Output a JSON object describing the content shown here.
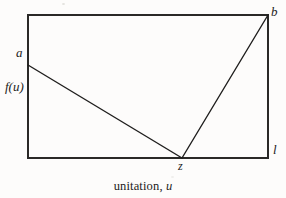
{
  "figure": {
    "caption_prefix": "unitation, ",
    "caption_variable": "u",
    "labels": {
      "a": "a",
      "b": "b",
      "l": "l",
      "z": "z",
      "f_of_u": "f(u)"
    },
    "colors": {
      "line": "#1f1e1d",
      "frame": "#2a2927",
      "background": "#fdfcfb",
      "text": "#1c1b1a"
    }
  },
  "chart_data": {
    "type": "line",
    "title": "",
    "subtitle": "",
    "xlabel": "unitation, u",
    "ylabel": "f(u)",
    "grid": false,
    "legend": null,
    "xlim": [
      0,
      1
    ],
    "ylim": [
      0,
      1
    ],
    "axis_ticks": {
      "x": [],
      "y": []
    },
    "frame": {
      "x_left_px": 28,
      "x_right_px": 268,
      "y_top_px": 15,
      "y_bottom_px": 158
    },
    "annotations": [
      {
        "text": "a",
        "x": 0.0,
        "y": 0.65,
        "position": "left-outside"
      },
      {
        "text": "b",
        "x": 1.0,
        "y": 1.0,
        "position": "top-right-outside"
      },
      {
        "text": "l",
        "x": 1.0,
        "y": 0.0,
        "position": "right-outside"
      },
      {
        "text": "z",
        "x": 0.64,
        "y": 0.0,
        "position": "below-axis"
      },
      {
        "text": "f(u)",
        "x": 0.0,
        "y": 0.49,
        "position": "left-outside"
      }
    ],
    "series": [
      {
        "name": "f(u)",
        "points": [
          {
            "label": "a",
            "x": 0.0,
            "y": 0.65
          },
          {
            "label": "z",
            "x": 0.64,
            "y": 0.0
          },
          {
            "label": "b",
            "x": 1.0,
            "y": 1.0
          }
        ],
        "x": [
          0.0,
          0.64,
          1.0
        ],
        "values": [
          0.65,
          0.0,
          1.0
        ],
        "pixel_points": [
          {
            "label": "a",
            "px": 28,
            "py": 65
          },
          {
            "label": "z",
            "px": 182,
            "py": 158
          },
          {
            "label": "b",
            "px": 268,
            "py": 15
          }
        ]
      }
    ]
  }
}
